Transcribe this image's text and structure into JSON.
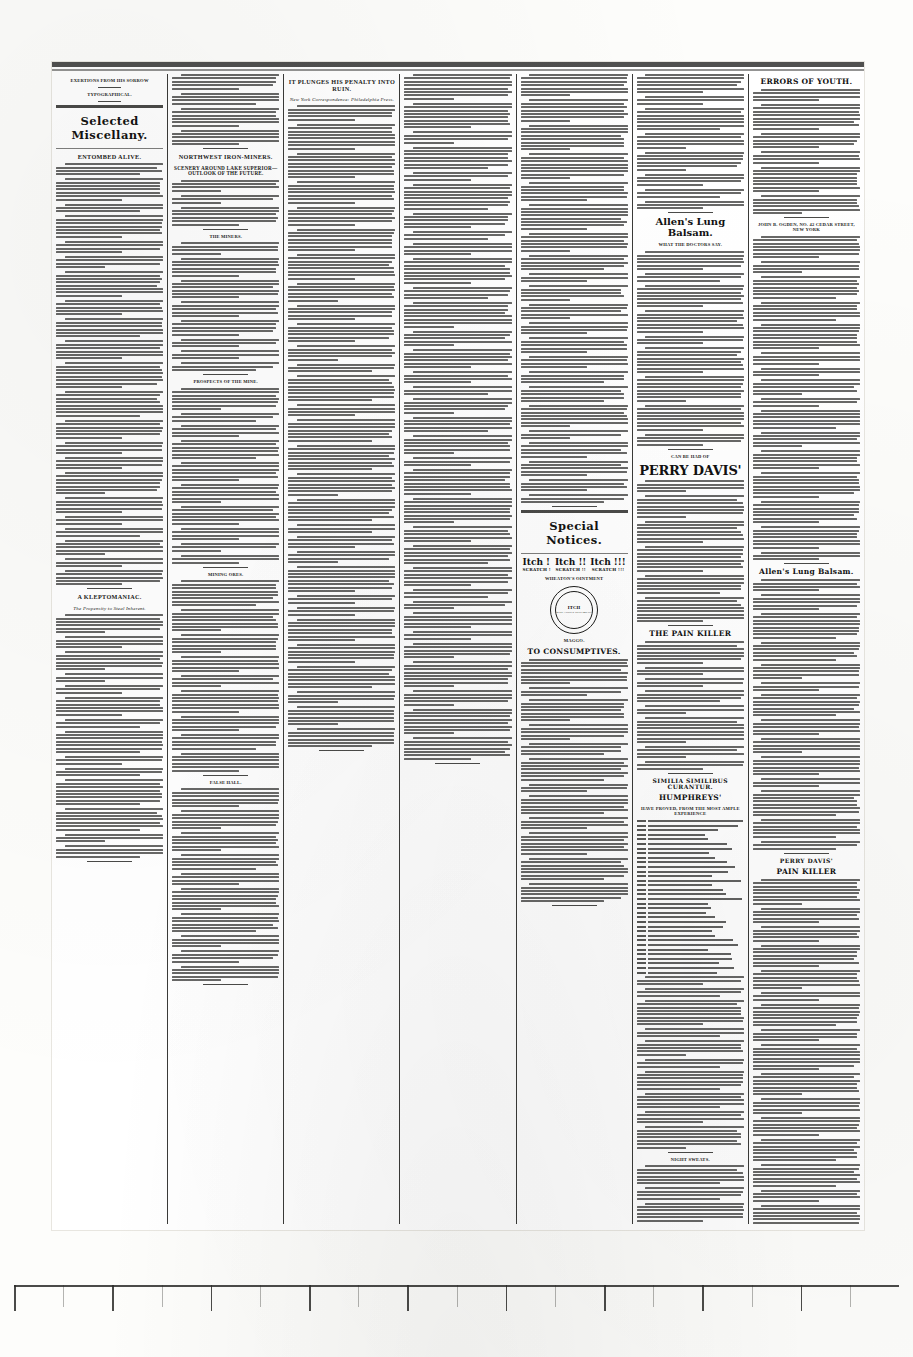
{
  "document": {
    "type": "scanned-newspaper-page",
    "layout": "seven-column-broadsheet",
    "ink_color": "#2a2a28",
    "paper_color": "#fdfdfb"
  },
  "ruler": {
    "visible": true,
    "major_ticks": 18,
    "minor_ticks": 17,
    "position": "bottom-margin"
  },
  "columns": [
    {
      "id": "col-1",
      "name": "poetry-and-selected-miscellany",
      "blocks": [
        {
          "kind": "heading",
          "level": "small",
          "text": "Exertions from his sorrow"
        },
        {
          "kind": "verse",
          "lines": 12
        },
        {
          "kind": "heading",
          "level": "small",
          "text": "TYPOGRAPHICAL."
        },
        {
          "kind": "verse",
          "lines": 14
        },
        {
          "kind": "banner",
          "text": "Selected Miscellany."
        },
        {
          "kind": "heading",
          "level": "main",
          "text": "ENTOMBED ALIVE."
        },
        {
          "kind": "body",
          "paragraphs": 22
        },
        {
          "kind": "heading",
          "level": "main",
          "text": "A KLEPTOMANIAC."
        },
        {
          "kind": "heading",
          "level": "ital",
          "text": "The Propensity to Steal Inherent."
        },
        {
          "kind": "body",
          "paragraphs": 14
        }
      ]
    },
    {
      "id": "col-2",
      "name": "northwest-iron-mines",
      "blocks": [
        {
          "kind": "body",
          "paragraphs": 4
        },
        {
          "kind": "heading",
          "level": "main",
          "text": "NORTHWEST IRON-MINERS."
        },
        {
          "kind": "heading",
          "level": "sub",
          "text": "Scenery Around Lake Superior—Outlook of the Future."
        },
        {
          "kind": "body",
          "paragraphs": 3
        },
        {
          "kind": "heading",
          "level": "small",
          "text": "THE MINERS."
        },
        {
          "kind": "body",
          "paragraphs": 8
        },
        {
          "kind": "heading",
          "level": "small",
          "text": "PROSPECTS OF THE MINE."
        },
        {
          "kind": "body",
          "paragraphs": 10
        },
        {
          "kind": "heading",
          "level": "small",
          "text": "MINING ORES."
        },
        {
          "kind": "body",
          "paragraphs": 9
        },
        {
          "kind": "heading",
          "level": "small",
          "text": "False Hall."
        },
        {
          "kind": "body",
          "paragraphs": 10
        }
      ]
    },
    {
      "id": "col-3",
      "name": "it-plunges-his-penalty-into-ruin",
      "blocks": [
        {
          "kind": "heading",
          "level": "main",
          "text": "It Plunges His Penalty into Ruin."
        },
        {
          "kind": "heading",
          "level": "ital",
          "text": "New York Correspondence: Philadelphia Press."
        },
        {
          "kind": "body",
          "paragraphs": 30
        }
      ]
    },
    {
      "id": "col-4",
      "name": "bread-fruit-tree-and-general-news",
      "blocks": [
        {
          "kind": "body",
          "paragraphs": 34
        }
      ]
    },
    {
      "id": "col-5",
      "name": "special-notices",
      "blocks": [
        {
          "kind": "body",
          "paragraphs": 22
        },
        {
          "kind": "banner",
          "text": "Special Notices."
        },
        {
          "kind": "itch",
          "words": [
            "Itch !",
            "Itch !!",
            "Itch !!!"
          ],
          "sub": [
            "SCRATCH !",
            "SCRATCH !!",
            "SCRATCH !!!"
          ]
        },
        {
          "kind": "heading",
          "level": "small",
          "text": "Wheaton's Ointment"
        },
        {
          "kind": "seal",
          "t1": "ITCH",
          "t2": "WHEATON'S OINTMENT"
        },
        {
          "kind": "heading",
          "level": "small",
          "text": "MAGGO."
        },
        {
          "kind": "ad-heading",
          "size": "md",
          "text": "TO CONSUMPTIVES."
        },
        {
          "kind": "body",
          "paragraphs": 12
        }
      ]
    },
    {
      "id": "col-6",
      "name": "patent-medicine-advertisements",
      "blocks": [
        {
          "kind": "body",
          "paragraphs": 8
        },
        {
          "kind": "ad-heading",
          "size": "lg",
          "text": "Allen's Lung Balsam."
        },
        {
          "kind": "heading",
          "level": "small",
          "text": "WHAT THE DOCTORS SAY."
        },
        {
          "kind": "body",
          "paragraphs": 9
        },
        {
          "kind": "heading",
          "level": "small",
          "text": "Can be had of"
        },
        {
          "kind": "ad-heading",
          "size": "xl",
          "text": "PERRY DAVIS'"
        },
        {
          "kind": "body",
          "paragraphs": 6
        },
        {
          "kind": "ad-heading",
          "size": "md",
          "text": "THE PAIN KILLER"
        },
        {
          "kind": "body",
          "paragraphs": 8
        },
        {
          "kind": "ad-heading",
          "size": "sm",
          "text": "SIMILIA SIMILIBUS CURANTUR."
        },
        {
          "kind": "ad-heading",
          "size": "md",
          "text": "HUMPHREYS'"
        },
        {
          "kind": "heading",
          "level": "small",
          "text": "HAVE PROVED, FROM THE MOST AMPLE EXPERIENCE"
        },
        {
          "kind": "numlist",
          "rows": 34
        },
        {
          "kind": "body",
          "paragraphs": 10
        },
        {
          "kind": "heading",
          "level": "small",
          "text": "NIGHT SWEATS."
        },
        {
          "kind": "body",
          "paragraphs": 3
        },
        {
          "kind": "heading",
          "level": "small",
          "text": "NEURALGIA."
        },
        {
          "kind": "body",
          "paragraphs": 3
        },
        {
          "kind": "heading",
          "level": "small",
          "text": "SCIATICA."
        },
        {
          "kind": "body",
          "paragraphs": 3
        },
        {
          "kind": "heading",
          "level": "small",
          "text": "LUMBAGO."
        },
        {
          "kind": "body",
          "paragraphs": 4
        },
        {
          "kind": "heading",
          "level": "small",
          "text": "DONALD KENNEDY, Roxbury, Mass."
        },
        {
          "kind": "body",
          "paragraphs": 6
        }
      ]
    },
    {
      "id": "col-7",
      "name": "errors-of-youth-and-remedies",
      "blocks": [
        {
          "kind": "ad-heading",
          "size": "md",
          "text": "ERRORS OF YOUTH."
        },
        {
          "kind": "body",
          "paragraphs": 6
        },
        {
          "kind": "heading",
          "level": "small",
          "text": "JOHN B. OGDEN, No. 42 Cedar street, New York"
        },
        {
          "kind": "body",
          "paragraphs": 16
        },
        {
          "kind": "ad-heading",
          "size": "md",
          "text": "Allen's Lung Balsam."
        },
        {
          "kind": "body",
          "paragraphs": 14
        },
        {
          "kind": "ad-heading",
          "size": "sm",
          "text": "PERRY DAVIS'"
        },
        {
          "kind": "ad-heading",
          "size": "md",
          "text": "PAIN KILLER"
        },
        {
          "kind": "body",
          "paragraphs": 18
        },
        {
          "kind": "ad-heading",
          "size": "sm",
          "text": "FAMILY CASES"
        },
        {
          "kind": "body",
          "paragraphs": 14
        },
        {
          "kind": "ad-heading",
          "size": "sm",
          "text": "Humphreys' Homeopathic Medicine Company"
        },
        {
          "kind": "body",
          "paragraphs": 8
        },
        {
          "kind": "ad-heading",
          "size": "md",
          "text": "THE GREATEST"
        },
        {
          "kind": "heading",
          "level": "small",
          "text": "OF THE AGE"
        },
        {
          "kind": "ad-heading",
          "size": "sm",
          "text": "AND NEURALGIA DISSOLVENT."
        },
        {
          "kind": "body",
          "paragraphs": 20
        },
        {
          "kind": "heading",
          "level": "small",
          "text": "RHEUMATISM."
        },
        {
          "kind": "body",
          "paragraphs": 8
        },
        {
          "kind": "heading",
          "level": "small",
          "text": "LUMBAGO."
        },
        {
          "kind": "body",
          "paragraphs": 10
        }
      ]
    }
  ]
}
